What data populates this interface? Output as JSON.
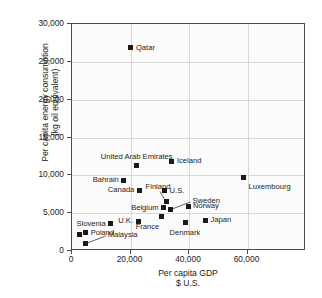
{
  "chart_data": {
    "type": "scatter",
    "title": "",
    "xlabel": "Per capita GDP $ U.S.",
    "xlabel_line1": "Per capita GDP",
    "xlabel_line2": "$ U.S.",
    "ylabel": "Per capita energy consumption (kg oil equivalent)",
    "ylabel_line1": "Per capita energy consumption",
    "ylabel_line2": "(kg oil equivalent)",
    "xlim": [
      0,
      80000
    ],
    "ylim": [
      0,
      30000
    ],
    "grid": true,
    "legend": "none",
    "marker_color": "#1a1a1a",
    "xticks": [
      0,
      20000,
      40000,
      60000
    ],
    "xtick_labels": [
      "0",
      "20,000",
      "40,000",
      "60,000"
    ],
    "yticks": [
      0,
      5000,
      10000,
      15000,
      20000,
      25000,
      30000
    ],
    "ytick_labels": [
      "0",
      "5,000",
      "10,000",
      "15,000",
      "20,000",
      "25,000",
      "30,000"
    ],
    "points": [
      {
        "name": "Qatar",
        "x": 20500,
        "y": 26700,
        "label": "Qatar",
        "label_pos": "right"
      },
      {
        "name": "Iceland",
        "x": 34500,
        "y": 11700,
        "label": "Iceland",
        "label_pos": "right"
      },
      {
        "name": "United Arab Emirates",
        "x": 22500,
        "y": 11200,
        "label": "United Arab Emirates",
        "label_pos": "above"
      },
      {
        "name": "Luxembourg",
        "x": 59000,
        "y": 9600,
        "label": "Luxembourg",
        "label_pos": "below-right"
      },
      {
        "name": "Bahrain",
        "x": 18000,
        "y": 9200,
        "label": "Bahrain",
        "label_pos": "left"
      },
      {
        "name": "Canada",
        "x": 23500,
        "y": 7900,
        "label": "Canada",
        "label_pos": "left"
      },
      {
        "name": "U.S.",
        "x": 32000,
        "y": 7800,
        "label": "U.S.",
        "label_pos": "right"
      },
      {
        "name": "Finland",
        "x": 32500,
        "y": 6400,
        "label": "Finland",
        "label_pos": "leader-above"
      },
      {
        "name": "Norway",
        "x": 40000,
        "y": 5800,
        "label": "Norway",
        "label_pos": "right"
      },
      {
        "name": "Belgium",
        "x": 31500,
        "y": 5600,
        "label": "Belgium",
        "label_pos": "left"
      },
      {
        "name": "Sweden",
        "x": 34000,
        "y": 5300,
        "label": "Sweden",
        "label_pos": "leader-right"
      },
      {
        "name": "France",
        "x": 31000,
        "y": 4400,
        "label": "France",
        "label_pos": "below-left"
      },
      {
        "name": "Japan",
        "x": 46000,
        "y": 3900,
        "label": "Japan",
        "label_pos": "right"
      },
      {
        "name": "U.K.",
        "x": 23000,
        "y": 3800,
        "label": "U.K.",
        "label_pos": "left"
      },
      {
        "name": "Denmark",
        "x": 39000,
        "y": 3600,
        "label": "Denmark",
        "label_pos": "below"
      },
      {
        "name": "Slovenia",
        "x": 13500,
        "y": 3500,
        "label": "Slovenia",
        "label_pos": "left"
      },
      {
        "name": "Poland",
        "x": 5000,
        "y": 2300,
        "label": "Poland",
        "label_pos": "right"
      },
      {
        "name": "Slovenia-lower",
        "x": 3000,
        "y": 2100,
        "label": "",
        "label_pos": "none"
      },
      {
        "name": "Malaysia",
        "x": 5000,
        "y": 800,
        "label": "Malaysia",
        "label_pos": "leader-right"
      }
    ]
  }
}
